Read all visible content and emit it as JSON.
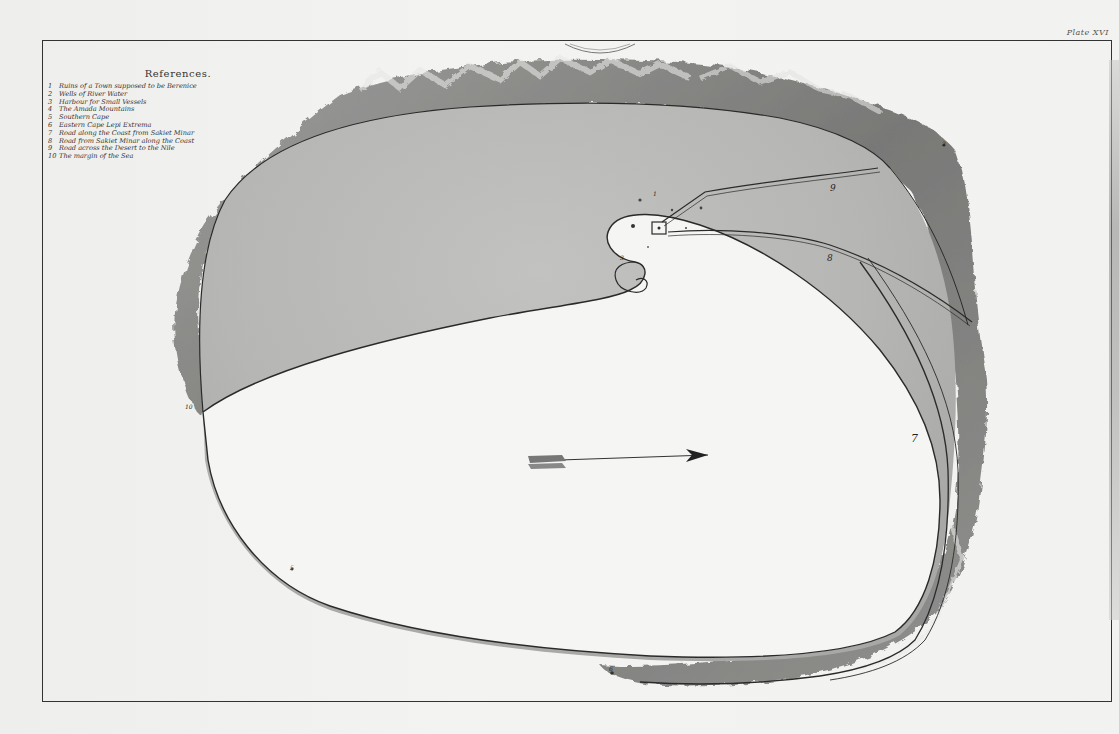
{
  "plate_label": "Plate XVI",
  "stamp_text": "LIBRARY",
  "references": {
    "title": "References.",
    "items": [
      {
        "num": "1",
        "label": "Ruins of a Town supposed to be Berenice"
      },
      {
        "num": "2",
        "label": "Wells of River Water"
      },
      {
        "num": "3",
        "label": "Harbour for Small Vessels"
      },
      {
        "num": "4",
        "label": "The Amada Mountains"
      },
      {
        "num": "5",
        "label": "Southern Cape"
      },
      {
        "num": "6",
        "label": "Eastern Cape Lepi Extrema"
      },
      {
        "num": "7",
        "label": "Road along the Coast from Sakiet Minar"
      },
      {
        "num": "8",
        "label": "Road from Sakiet Minar along the Coast"
      },
      {
        "num": "9",
        "label": "Road across the Desert to the Nile"
      },
      {
        "num": "10",
        "label": "The margin of the Sea"
      }
    ]
  },
  "map_labels": {
    "road_9": "9",
    "road_8": "8",
    "road_7": "7",
    "harbour_3": "3",
    "ruins_1": "1",
    "cape_6": "6",
    "cape_5": "5",
    "margin_10": "10",
    "mount_2": "2"
  },
  "colors": {
    "paper": "#f1f1ef",
    "land_shade": "#b9b9b7",
    "sea": "#f4f4f2",
    "mountains": "#6a6a68",
    "ink": "#2a2a2a"
  },
  "north_arrow": "arrow-icon"
}
